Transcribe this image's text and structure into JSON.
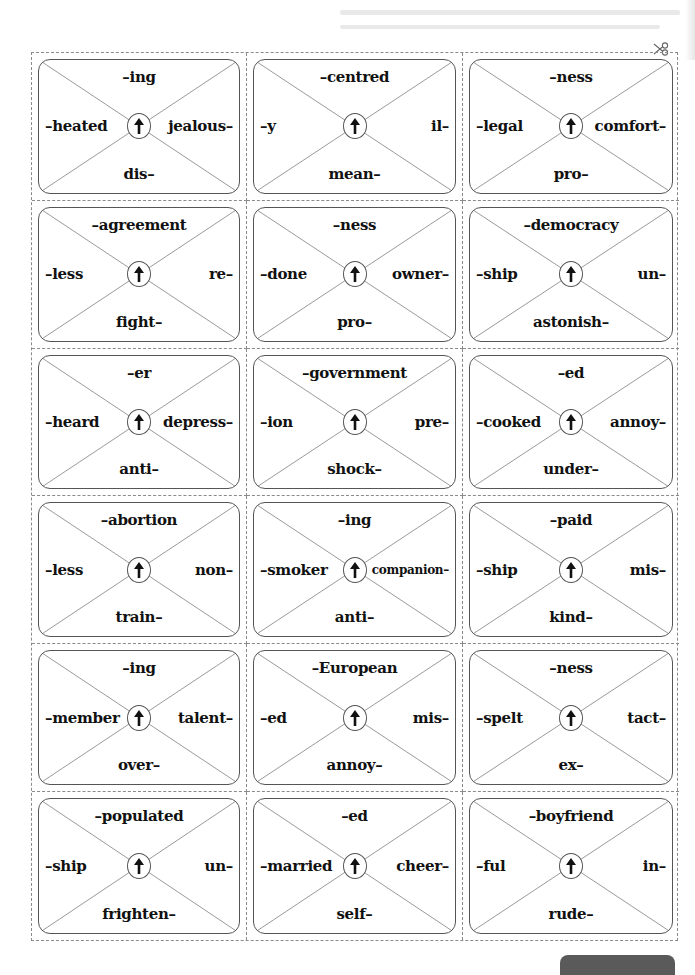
{
  "worksheet": {
    "cut_guide_icon": "scissors-icon",
    "center_icon": "up-arrow-icon",
    "cards": [
      {
        "top": "–ing",
        "left": "–heated",
        "right": "jealous–",
        "bottom": "dis–"
      },
      {
        "top": "–centred",
        "left": "–y",
        "right": "il–",
        "bottom": "mean–"
      },
      {
        "top": "–ness",
        "left": "–legal",
        "right": "comfort–",
        "bottom": "pro–"
      },
      {
        "top": "–agreement",
        "left": "–less",
        "right": "re–",
        "bottom": "fight–"
      },
      {
        "top": "–ness",
        "left": "–done",
        "right": "owner–",
        "bottom": "pro–"
      },
      {
        "top": "–democracy",
        "left": "–ship",
        "right": "un–",
        "bottom": "astonish–"
      },
      {
        "top": "–er",
        "left": "–heard",
        "right": "depress–",
        "bottom": "anti–"
      },
      {
        "top": "–government",
        "left": "–ion",
        "right": "pre–",
        "bottom": "shock–"
      },
      {
        "top": "–ed",
        "left": "–cooked",
        "right": "annoy–",
        "bottom": "under–"
      },
      {
        "top": "–abortion",
        "left": "–less",
        "right": "non–",
        "bottom": "train–"
      },
      {
        "top": "–ing",
        "left": "–smoker",
        "right": "companion–",
        "bottom": "anti–"
      },
      {
        "top": "–paid",
        "left": "–ship",
        "right": "mis–",
        "bottom": "kind–"
      },
      {
        "top": "–ing",
        "left": "–member",
        "right": "talent–",
        "bottom": "over–"
      },
      {
        "top": "–European",
        "left": "–ed",
        "right": "mis–",
        "bottom": "annoy–"
      },
      {
        "top": "–ness",
        "left": "–spelt",
        "right": "tact–",
        "bottom": "ex–"
      },
      {
        "top": "–populated",
        "left": "–ship",
        "right": "un–",
        "bottom": "frighten–"
      },
      {
        "top": "–ed",
        "left": "–married",
        "right": "cheer–",
        "bottom": "self–"
      },
      {
        "top": "–boyfriend",
        "left": "–ful",
        "right": "in–",
        "bottom": "rude–"
      }
    ]
  },
  "colors": {
    "border": "#555555",
    "dashed": "#8a8a8a",
    "text": "#111111",
    "tab": "#5a5a5a"
  }
}
